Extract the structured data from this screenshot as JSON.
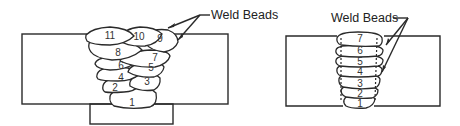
{
  "figure": {
    "left_diagram": {
      "label": "Weld Beads",
      "description": "Multi-pass weld with stringer/weave beads, backing bar",
      "beads": [
        "1",
        "2",
        "3",
        "4",
        "5",
        "6",
        "7",
        "8",
        "9",
        "10",
        "11"
      ]
    },
    "right_diagram": {
      "label": "Weld Beads",
      "description": "Multi-pass weave weld, one bead per layer",
      "beads": [
        "1",
        "2",
        "3",
        "4",
        "5",
        "6",
        "7"
      ]
    }
  }
}
